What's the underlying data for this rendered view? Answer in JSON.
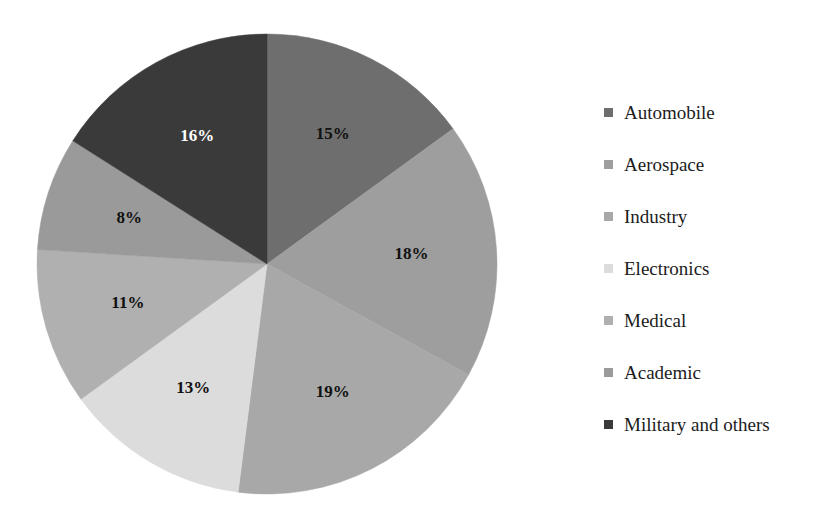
{
  "chart_data": {
    "type": "pie",
    "title": "",
    "subtitle": "",
    "xlabel": "",
    "ylabel": "",
    "grid": false,
    "legend_position": "right",
    "start_angle_deg": 0,
    "direction": "clockwise",
    "categories": [
      "Automobile",
      "Aerospace",
      "Industry",
      "Electronics",
      "Medical",
      "Academic",
      "Military and others"
    ],
    "values": [
      15,
      18,
      19,
      13,
      11,
      8,
      16
    ],
    "value_unit": "%",
    "data_labels": [
      "15%",
      "18%",
      "19%",
      "13%",
      "11%",
      "8%",
      "16%"
    ],
    "colors": [
      "#6e6e6e",
      "#9e9e9e",
      "#a8a8a8",
      "#dcdcdc",
      "#b0b0b0",
      "#9a9a9a",
      "#3a3a3a"
    ],
    "label_colors": [
      "#111111",
      "#111111",
      "#111111",
      "#111111",
      "#111111",
      "#111111",
      "#ffffff"
    ],
    "slices": [
      {
        "label": "Automobile",
        "value": 15,
        "data_label": "15%",
        "color": "#6e6e6e",
        "label_color": "#111111"
      },
      {
        "label": "Aerospace",
        "value": 18,
        "data_label": "18%",
        "color": "#9e9e9e",
        "label_color": "#111111"
      },
      {
        "label": "Industry",
        "value": 19,
        "data_label": "19%",
        "color": "#a8a8a8",
        "label_color": "#111111"
      },
      {
        "label": "Electronics",
        "value": 13,
        "data_label": "13%",
        "color": "#dcdcdc",
        "label_color": "#111111"
      },
      {
        "label": "Medical",
        "value": 11,
        "data_label": "11%",
        "color": "#b0b0b0",
        "label_color": "#111111"
      },
      {
        "label": "Academic",
        "value": 8,
        "data_label": "8%",
        "color": "#9a9a9a",
        "label_color": "#111111"
      },
      {
        "label": "Military and others",
        "value": 16,
        "data_label": "16%",
        "color": "#3a3a3a",
        "label_color": "#ffffff"
      }
    ]
  },
  "legend": {
    "items": [
      {
        "label": "Automobile",
        "color": "#6e6e6e"
      },
      {
        "label": "Aerospace",
        "color": "#9e9e9e"
      },
      {
        "label": "Industry",
        "color": "#a8a8a8"
      },
      {
        "label": "Electronics",
        "color": "#dcdcdc"
      },
      {
        "label": "Medical",
        "color": "#b0b0b0"
      },
      {
        "label": "Academic",
        "color": "#9a9a9a"
      },
      {
        "label": "Military and others",
        "color": "#3a3a3a"
      }
    ]
  }
}
